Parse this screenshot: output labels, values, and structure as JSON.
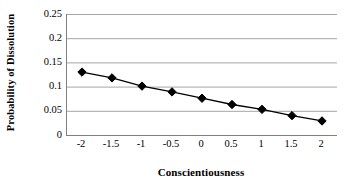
{
  "chart_data": {
    "type": "line",
    "title": "",
    "xlabel": "Conscientiousness",
    "ylabel": "Probability of Dissolution",
    "categories": [
      "-2",
      "-1.5",
      "-1",
      "-0.5",
      "0",
      "0.5",
      "1",
      "1.5",
      "2"
    ],
    "x": [
      -2,
      -1.5,
      -1,
      -0.5,
      0,
      0.5,
      1,
      1.5,
      2
    ],
    "values": [
      0.13,
      0.118,
      0.101,
      0.089,
      0.076,
      0.063,
      0.053,
      0.04,
      0.029
    ],
    "series": [
      {
        "name": "Probability of Dissolution",
        "values": [
          0.13,
          0.118,
          0.101,
          0.089,
          0.076,
          0.063,
          0.053,
          0.04,
          0.029
        ]
      }
    ],
    "ylim": [
      0,
      0.25
    ],
    "yticks": [
      "0",
      "0.05",
      "0.1",
      "0.15",
      "0.2",
      "0.25"
    ],
    "ytick_values": [
      0,
      0.05,
      0.1,
      0.15,
      0.2,
      0.25
    ],
    "xtick_labels": [
      "-2",
      "-1.5",
      "-1",
      "-0.5",
      "0",
      "0.5",
      "1",
      "1.5",
      "2"
    ],
    "grid": "horizontal",
    "legend": "none",
    "marker": "diamond",
    "line_color": "#000000",
    "marker_color": "#000000",
    "grid_color": "#a6a6a6",
    "axis_color": "#808080",
    "background": "#ffffff"
  },
  "axis": {
    "y_title": "Probability of Dissolution",
    "x_title": "Conscientiousness",
    "y_labels": [
      "0.25",
      "0.2",
      "0.15",
      "0.1",
      "0.05",
      "0"
    ],
    "x_labels": [
      "-2",
      "-1.5",
      "-1",
      "-0.5",
      "0",
      "0.5",
      "1",
      "1.5",
      "2"
    ]
  }
}
